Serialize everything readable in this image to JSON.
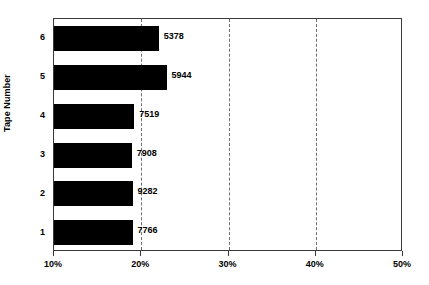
{
  "chart_data": {
    "type": "bar",
    "orientation": "horizontal",
    "title": "",
    "xlabel": "",
    "ylabel": "Tape Number",
    "categories": [
      "1",
      "2",
      "3",
      "4",
      "5",
      "6"
    ],
    "values": [
      19.0,
      19.0,
      18.9,
      19.2,
      22.9,
      22.0
    ],
    "data_labels": [
      "7766",
      "9282",
      "7908",
      "7519",
      "5944",
      "5378"
    ],
    "xlim": [
      10,
      50
    ],
    "xticks": [
      10,
      20,
      30,
      40,
      50
    ],
    "xtick_labels": [
      "10%",
      "20%",
      "30%",
      "40%",
      "50%"
    ],
    "grid": {
      "vertical": true,
      "horizontal": false,
      "style": "dashed",
      "at": [
        20,
        30,
        40
      ]
    },
    "legend": null,
    "bar_color": "#000000",
    "axis_color": "#3a3a3a",
    "grid_color": "#6e6e6e",
    "background": "#ffffff"
  }
}
